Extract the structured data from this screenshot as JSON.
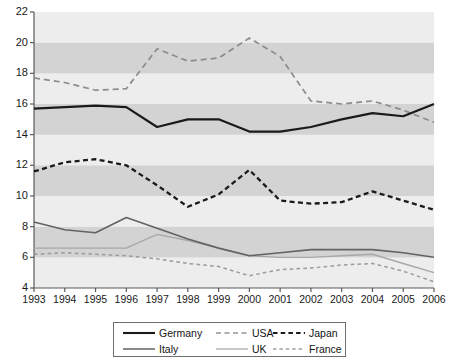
{
  "chart_data": {
    "type": "line",
    "title": "",
    "xlabel": "",
    "ylabel": "",
    "x": [
      1993,
      1994,
      1995,
      1996,
      1997,
      1998,
      1999,
      2000,
      2001,
      2002,
      2003,
      2004,
      2005,
      2006
    ],
    "xlim": [
      1993,
      2006
    ],
    "ylim": [
      4,
      22
    ],
    "ytick_values": [
      4,
      6,
      8,
      10,
      12,
      14,
      16,
      18,
      20,
      22
    ],
    "ytick_labels": [
      "4",
      "6",
      "8",
      "10",
      "12",
      "14",
      "16",
      "18",
      "20",
      "22"
    ],
    "xtick_labels": [
      "1993",
      "1994",
      "1995",
      "1996",
      "1997",
      "1998",
      "1999",
      "2000",
      "2001",
      "2002",
      "2003",
      "2004",
      "2005",
      "2006"
    ],
    "grid": "horizontal alternating gray bands",
    "legend_position": "below-axes",
    "series": [
      {
        "name": "Germany",
        "style": "solid-thick-black",
        "color": "#1a1a1a",
        "values": [
          15.7,
          15.8,
          15.9,
          15.8,
          14.5,
          15.0,
          15.0,
          14.2,
          14.2,
          14.5,
          15.0,
          15.4,
          15.2,
          16.0
        ]
      },
      {
        "name": "USA",
        "style": "long-dash-gray",
        "color": "#8c8c8c",
        "values": [
          17.7,
          17.4,
          16.9,
          17.0,
          19.6,
          18.8,
          19.0,
          20.3,
          19.1,
          16.2,
          16.0,
          16.2,
          15.6,
          14.8
        ]
      },
      {
        "name": "Japan",
        "style": "heavy-dash-black",
        "color": "#1a1a1a",
        "values": [
          11.6,
          12.2,
          12.4,
          12.0,
          10.7,
          9.3,
          10.1,
          11.7,
          9.7,
          9.5,
          9.6,
          10.3,
          9.7,
          9.1
        ]
      },
      {
        "name": "Italy",
        "style": "solid-medium-gray",
        "color": "#636363",
        "values": [
          8.3,
          7.8,
          7.6,
          8.6,
          7.9,
          7.2,
          6.6,
          6.1,
          6.3,
          6.5,
          6.5,
          6.5,
          6.3,
          6.0
        ]
      },
      {
        "name": "UK",
        "style": "solid-light-gray",
        "color": "#a8a8a8",
        "values": [
          6.6,
          6.6,
          6.6,
          6.6,
          7.5,
          7.1,
          6.6,
          6.1,
          6.0,
          6.0,
          6.1,
          6.2,
          5.6,
          5.0
        ]
      },
      {
        "name": "France",
        "style": "short-dash-gray",
        "color": "#9a9a9a",
        "values": [
          6.2,
          6.3,
          6.2,
          6.1,
          5.9,
          5.6,
          5.4,
          4.8,
          5.2,
          5.3,
          5.5,
          5.6,
          5.1,
          4.4
        ]
      }
    ]
  },
  "legend": {
    "items": [
      {
        "label": "Germany",
        "key": "germany"
      },
      {
        "label": "USA",
        "key": "usa"
      },
      {
        "label": "Japan",
        "key": "japan"
      },
      {
        "label": "Italy",
        "key": "italy"
      },
      {
        "label": "UK",
        "key": "uk"
      },
      {
        "label": "France",
        "key": "france"
      }
    ]
  }
}
